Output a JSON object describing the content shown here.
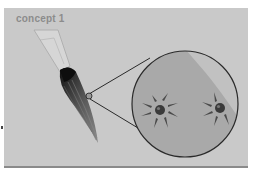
{
  "figure": {
    "label": "concept 1",
    "elements": {
      "brush": "paintbrush-with-dark-bristles",
      "magnifier": "zoom-circle-on-bristles",
      "detail": "magnified-view-circle",
      "particles": [
        {
          "name": "particle-left",
          "arrows": 8
        },
        {
          "name": "particle-right",
          "arrows": 5
        }
      ]
    },
    "colors": {
      "background": "#c9c9c9",
      "circle_fill": "#a9a9a9",
      "circle_highlight": "#bcbcbc",
      "outline": "#2a2a2a",
      "label": "#8c8c8c",
      "bristles": "#3c3c3c"
    }
  }
}
